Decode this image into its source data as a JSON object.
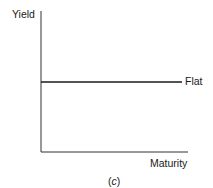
{
  "chart_data": {
    "type": "line",
    "title": "",
    "xlabel": "Maturity",
    "ylabel": "Yield",
    "caption": "(c)",
    "caption_parts": {
      "open": "(",
      "letter": "c",
      "close": ")"
    },
    "series": [
      {
        "name": "Flat",
        "x": [
          0,
          1
        ],
        "values": [
          0.5,
          0.5
        ]
      }
    ],
    "xlim": [
      0,
      1
    ],
    "ylim": [
      0,
      1
    ],
    "grid": false,
    "ticks": false,
    "legend": "inline label at right end of line",
    "colors": {
      "axis": "#333333",
      "line": "#1a1a1a"
    }
  }
}
